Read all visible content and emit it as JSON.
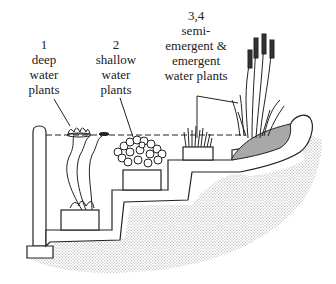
{
  "diagram": {
    "labels": [
      {
        "id": "zone-1",
        "number": "1",
        "lines": [
          "deep",
          "water",
          "plants"
        ]
      },
      {
        "id": "zone-2",
        "number": "2",
        "lines": [
          "shallow",
          "water",
          "plants"
        ]
      },
      {
        "id": "zone-3-4",
        "number": "3,4",
        "lines": [
          "semi-",
          "emergent &",
          "emergent",
          "water plants"
        ]
      }
    ],
    "colors": {
      "line": "#222222",
      "soil_dots": "#9a9a9a",
      "bank_fill": "#a8a8a8",
      "background": "#ffffff"
    }
  }
}
